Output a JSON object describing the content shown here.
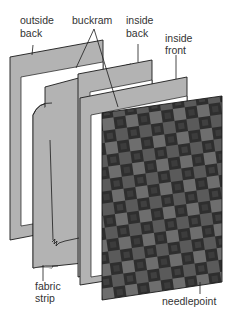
{
  "diagram": {
    "type": "exploded-assembly",
    "labels": {
      "outside_back": [
        "outside",
        "back"
      ],
      "buckram": "buckram",
      "inside_back": [
        "inside",
        "back"
      ],
      "inside_front": [
        "inside",
        "front"
      ],
      "fabric_strip": [
        "fabric",
        "strip"
      ],
      "needlepoint": "needlepoint"
    },
    "colors": {
      "panel_gray": "#b3b3b3",
      "outline": "#1a1a1a",
      "frame_interior": "#ffffff",
      "needlepoint_dark": "#2e2e2e",
      "needlepoint_mid": "#555555",
      "needlepoint_light": "#7a7a7a"
    }
  }
}
